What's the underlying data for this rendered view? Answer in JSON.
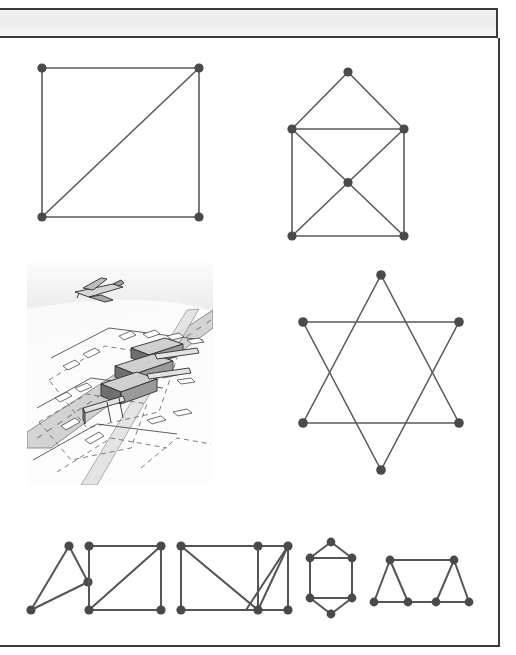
{
  "page": {
    "title": "",
    "background_color": "#ffffff",
    "frame_color": "#3a3a3a",
    "header_band_color": "#efefef"
  },
  "figure": {
    "label": "",
    "ink_color": "#5b5b5b",
    "vertex_color": "#4a4a4a",
    "graphs": [
      {
        "id": "graph-square-diagonal",
        "name": "square-with-diagonal-graph",
        "vertex_count": 4,
        "edge_count": 5,
        "description": "Square with one diagonal"
      },
      {
        "id": "graph-house-x",
        "name": "house-with-crossed-square-graph",
        "vertex_count": 6,
        "edge_count": 9,
        "description": "House shape with X inside the square body"
      },
      {
        "id": "graph-hexagram",
        "name": "star-of-david-graph",
        "vertex_count": 6,
        "edge_count": 6,
        "description": "Hexagram formed by two overlapping triangles"
      },
      {
        "id": "graph-triangle",
        "name": "triangle-graph",
        "vertex_count": 3,
        "edge_count": 3,
        "description": "Scalene triangle"
      },
      {
        "id": "graph-square-diagonal-2",
        "name": "square-with-diagonal-graph-small",
        "vertex_count": 4,
        "edge_count": 5,
        "description": "Square with one diagonal"
      },
      {
        "id": "graph-grid-diagonals",
        "name": "rectangle-grid-with-diagonals-graph",
        "vertex_count": 6,
        "edge_count": 9,
        "description": "Rectangle split by a vertical with two diagonals"
      },
      {
        "id": "graph-barrel",
        "name": "hexagonal-barrel-graph",
        "vertex_count": 6,
        "edge_count": 7,
        "description": "Barrel / elongated hexagon with two cross rungs"
      },
      {
        "id": "graph-triangular-strip",
        "name": "triangular-strip-graph",
        "vertex_count": 6,
        "edge_count": 8,
        "description": "Trapezoid strip made of triangles"
      }
    ]
  },
  "illustration": {
    "id": "airport-illustration",
    "name": "airport-aerial-illustration",
    "alt": "Aerial pen-and-ink drawing of an airport with runways, taxiways, terminal buildings and an airplane in flight",
    "style": "grayscale line drawing",
    "sky_color": "#f4f4f4",
    "ground_color": "#fbfbfb",
    "runway_color": "#d9d9d9",
    "ink_color": "#444444"
  }
}
